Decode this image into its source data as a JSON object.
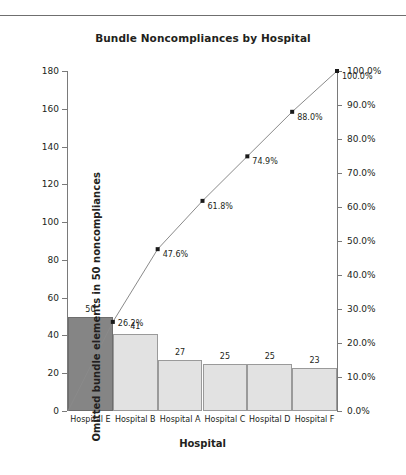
{
  "chart_data": {
    "type": "bar",
    "title": "Bundle Noncompliances by Hospital",
    "xlabel": "Hospital",
    "ylabel": "Omitted bundle elements in 50 noncompliances",
    "categories": [
      "Hospital E",
      "Hospital B",
      "Hospital A",
      "Hospital C",
      "Hospital D",
      "Hospital F"
    ],
    "values": [
      50,
      41,
      27,
      25,
      25,
      23
    ],
    "value_labels": [
      "50",
      "41",
      "27",
      "25",
      "25",
      "23"
    ],
    "cumulative_percent": [
      26.2,
      47.6,
      61.8,
      74.9,
      88.0,
      100.0
    ],
    "cumulative_labels": [
      "26.2%",
      "47.6%",
      "61.8%",
      "74.9%",
      "88.0%",
      "100.0%"
    ],
    "ylim": [
      0,
      180
    ],
    "yticks": [
      0,
      20,
      40,
      60,
      80,
      100,
      120,
      140,
      160,
      180
    ],
    "ytick_labels": [
      "0",
      "20",
      "40",
      "60",
      "80",
      "100",
      "120",
      "140",
      "160",
      "180"
    ],
    "y2lim": [
      0,
      100
    ],
    "y2ticks": [
      0,
      10,
      20,
      30,
      40,
      50,
      60,
      70,
      80,
      90,
      100
    ],
    "y2tick_labels": [
      "0.0%",
      "10.0%",
      "20.0%",
      "30.0%",
      "40.0%",
      "50.0%",
      "60.0%",
      "70.0%",
      "80.0%",
      "90.0%",
      "100.0%"
    ],
    "ylabel_right": "",
    "grid": false,
    "legend": false,
    "bar_color": "#e2e2e2",
    "bar_highlight_color": "#858585",
    "bar_border_color": "#9a9a9a",
    "line_color": "#8a8a8a",
    "marker_color": "#1a1a1a",
    "axis_color": "#7a7a7a",
    "highlight_index": 0
  }
}
